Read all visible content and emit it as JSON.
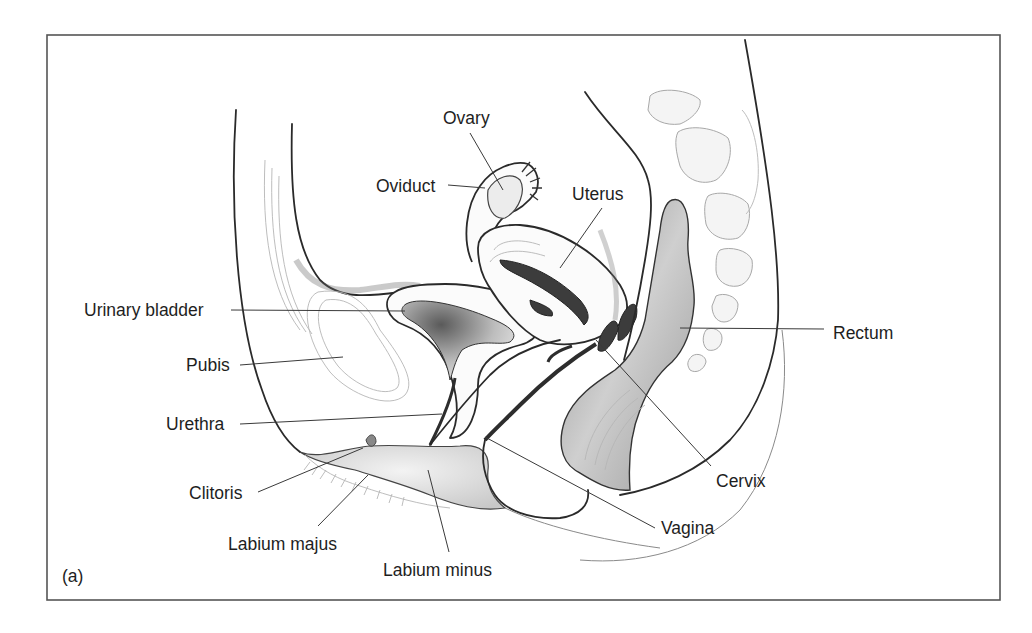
{
  "figure": {
    "panel_label": "(a)",
    "frame": {
      "x": 47,
      "y": 35,
      "width": 953,
      "height": 565,
      "stroke": "#555555"
    },
    "text_color": "#1e1e1e",
    "line_color": "#3a3a3a"
  },
  "labels": [
    {
      "id": "ovary",
      "text": "Ovary",
      "x": 443,
      "y": 124,
      "anchor": "start",
      "leader": [
        [
          470,
          133
        ],
        [
          503,
          190
        ]
      ]
    },
    {
      "id": "oviduct",
      "text": "Oviduct",
      "x": 376,
      "y": 192,
      "anchor": "start",
      "leader": [
        [
          448,
          185
        ],
        [
          485,
          188
        ]
      ]
    },
    {
      "id": "uterus",
      "text": "Uterus",
      "x": 572,
      "y": 200,
      "anchor": "start",
      "leader": [
        [
          602,
          208
        ],
        [
          560,
          268
        ]
      ]
    },
    {
      "id": "urinary-bladder",
      "text": "Urinary bladder",
      "x": 84,
      "y": 316,
      "anchor": "start",
      "leader": [
        [
          231,
          310
        ],
        [
          405,
          311
        ]
      ]
    },
    {
      "id": "rectum",
      "text": "Rectum",
      "x": 833,
      "y": 339,
      "anchor": "start",
      "leader": [
        [
          680,
          328
        ],
        [
          824,
          329
        ]
      ]
    },
    {
      "id": "pubis",
      "text": "Pubis",
      "x": 186,
      "y": 371,
      "anchor": "start",
      "leader": [
        [
          240,
          365
        ],
        [
          343,
          357
        ]
      ]
    },
    {
      "id": "urethra",
      "text": "Urethra",
      "x": 166,
      "y": 430,
      "anchor": "start",
      "leader": [
        [
          240,
          424
        ],
        [
          442,
          414
        ]
      ]
    },
    {
      "id": "cervix",
      "text": "Cervix",
      "x": 716,
      "y": 487,
      "anchor": "start",
      "leader": [
        [
          596,
          340
        ],
        [
          711,
          466
        ]
      ]
    },
    {
      "id": "clitoris",
      "text": "Clitoris",
      "x": 189,
      "y": 499,
      "anchor": "start",
      "leader": [
        [
          258,
          492
        ],
        [
          363,
          448
        ]
      ]
    },
    {
      "id": "vagina",
      "text": "Vagina",
      "x": 661,
      "y": 534,
      "anchor": "start",
      "leader": [
        [
          485,
          437
        ],
        [
          655,
          528
        ]
      ]
    },
    {
      "id": "labium-majus",
      "text": "Labium majus",
      "x": 228,
      "y": 550,
      "anchor": "start",
      "leader": [
        [
          318,
          526
        ],
        [
          368,
          475
        ]
      ]
    },
    {
      "id": "labium-minus",
      "text": "Labium minus",
      "x": 383,
      "y": 576,
      "anchor": "start",
      "leader": [
        [
          449,
          552
        ],
        [
          428,
          470
        ]
      ]
    }
  ]
}
